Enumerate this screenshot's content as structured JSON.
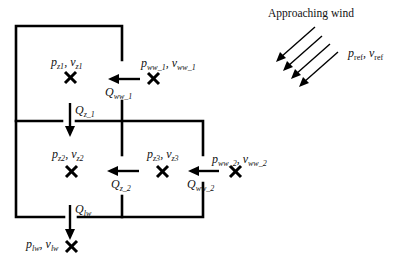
{
  "title": "Approaching wind",
  "reference": {
    "p": "p",
    "p_sub": "ref",
    "v": "v",
    "v_sub": "ref"
  },
  "zones": [
    {
      "id": "z1",
      "p": "p",
      "p_sub": "z1",
      "v": "v",
      "v_sub": "z1"
    },
    {
      "id": "z2",
      "p": "p",
      "p_sub": "z2",
      "v": "v",
      "v_sub": "z2"
    },
    {
      "id": "z3",
      "p": "p",
      "p_sub": "z3",
      "v": "v",
      "v_sub": "z3"
    }
  ],
  "nodes": {
    "ww1": {
      "p": "p",
      "p_sub": "ww_1",
      "v": "v",
      "v_sub": "ww_1"
    },
    "ww2": {
      "p": "p",
      "p_sub": "ww_2",
      "v": "v",
      "v_sub": "ww_2"
    },
    "lw": {
      "p": "p",
      "p_sub": "lw",
      "v": "v",
      "v_sub": "lw"
    }
  },
  "flows": {
    "Qww1": {
      "q": "Q",
      "sub": "ww_1"
    },
    "Qz1": {
      "q": "Q",
      "sub": "z_1"
    },
    "Qz2": {
      "q": "Q",
      "sub": "z_2"
    },
    "Qww2": {
      "q": "Q",
      "sub": "ww_2"
    },
    "Qlw": {
      "q": "Q",
      "sub": "lw"
    }
  },
  "separator": ", "
}
